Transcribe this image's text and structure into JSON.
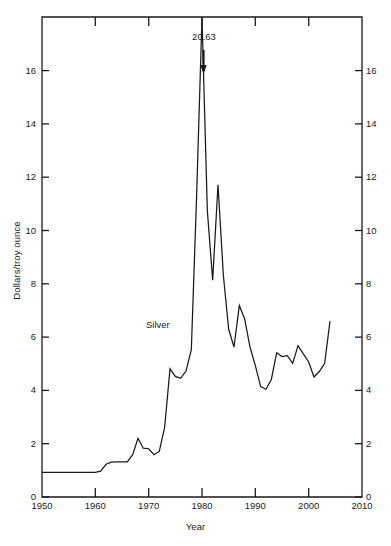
{
  "chart_data": {
    "type": "line",
    "title": "",
    "xlabel": "Year",
    "ylabel": "Dollars/troy ounce",
    "xlim": [
      1950,
      2010
    ],
    "ylim": [
      0,
      17.6
    ],
    "grid": false,
    "legend_position": "inline-label",
    "series_label": "Silver",
    "xticks": [
      1950,
      1960,
      1970,
      1980,
      1990,
      2000,
      2010
    ],
    "xtick_labels": [
      "1950",
      "1960",
      "1970",
      "1980",
      "1990",
      "2000",
      "2010"
    ],
    "yticks": [
      0,
      2,
      4,
      6,
      8,
      10,
      12,
      14,
      16
    ],
    "ytick_labels": [
      "0",
      "2",
      "4",
      "6",
      "8",
      "10",
      "12",
      "14",
      "16"
    ],
    "annotations": [
      {
        "text": "20.63",
        "x": 1980,
        "y": 20.63,
        "note": "off-scale peak marked with arrow above plot area"
      }
    ],
    "series": [
      {
        "name": "Silver",
        "x": [
          1950,
          1951,
          1952,
          1953,
          1954,
          1955,
          1956,
          1957,
          1958,
          1959,
          1960,
          1961,
          1962,
          1963,
          1964,
          1965,
          1966,
          1967,
          1968,
          1969,
          1970,
          1971,
          1972,
          1973,
          1974,
          1975,
          1976,
          1977,
          1978,
          1979,
          1980,
          1981,
          1982,
          1983,
          1984,
          1985,
          1986,
          1987,
          1988,
          1989,
          1990,
          1991,
          1992,
          1993,
          1994,
          1995,
          1996,
          1997,
          1998,
          1999,
          2000,
          2001,
          2002,
          2003,
          2004
        ],
        "values": [
          0.9,
          0.9,
          0.9,
          0.9,
          0.9,
          0.9,
          0.9,
          0.9,
          0.9,
          0.9,
          0.9,
          0.95,
          1.2,
          1.28,
          1.29,
          1.29,
          1.29,
          1.55,
          2.15,
          1.79,
          1.77,
          1.55,
          1.68,
          2.56,
          4.7,
          4.42,
          4.35,
          4.62,
          5.4,
          11.1,
          20.63,
          10.5,
          7.95,
          11.45,
          8.15,
          6.15,
          5.5,
          7.02,
          6.53,
          5.5,
          4.82,
          4.05,
          3.95,
          4.31,
          5.29,
          5.15,
          5.18,
          4.9,
          5.55,
          5.25,
          4.95,
          4.4,
          4.6,
          4.9,
          6.45
        ]
      }
    ]
  }
}
